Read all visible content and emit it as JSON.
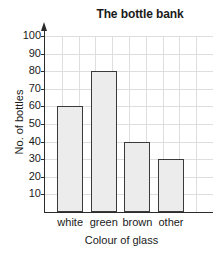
{
  "chart_data": {
    "type": "bar",
    "title": "The bottle bank",
    "xlabel": "Colour of glass",
    "ylabel": "No. of bottles",
    "categories": [
      "white",
      "green",
      "brown",
      "other"
    ],
    "values": [
      60,
      80,
      40,
      30
    ],
    "ylim": [
      0,
      100
    ],
    "ytick_labels": [
      "100",
      "90",
      "80",
      "70",
      "60",
      "50",
      "40",
      "30",
      "20",
      "10"
    ],
    "ytick_values": [
      100,
      90,
      80,
      70,
      60,
      50,
      40,
      30,
      20,
      10
    ],
    "ytick_step": 10,
    "grid": true,
    "grid_orientation": "both",
    "legend": false,
    "bar_fill": "#ececec",
    "bar_edge": "#3a3a3a",
    "grid_color": "#dedede",
    "axis_color": "#2b2b2b",
    "y_axis_arrow": true
  }
}
